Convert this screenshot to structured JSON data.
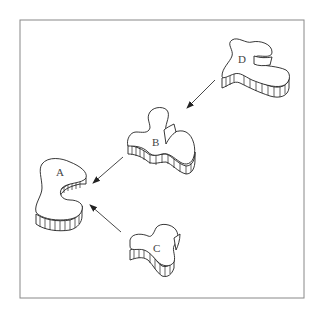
{
  "diagram": {
    "type": "assembly-flow",
    "frame": {
      "x": 20,
      "y": 20,
      "width": 284,
      "height": 278,
      "border_color": "#888888"
    },
    "nodes": [
      {
        "id": "A",
        "label": "A",
        "x": 60,
        "y": 170
      },
      {
        "id": "B",
        "label": "B",
        "x": 156,
        "y": 141
      },
      {
        "id": "C",
        "label": "C",
        "x": 158,
        "y": 248
      },
      {
        "id": "D",
        "label": "D",
        "x": 241,
        "y": 62
      }
    ],
    "edges": [
      {
        "from": "D",
        "to": "B"
      },
      {
        "from": "B",
        "to": "A"
      },
      {
        "from": "C",
        "to": "A"
      }
    ]
  }
}
